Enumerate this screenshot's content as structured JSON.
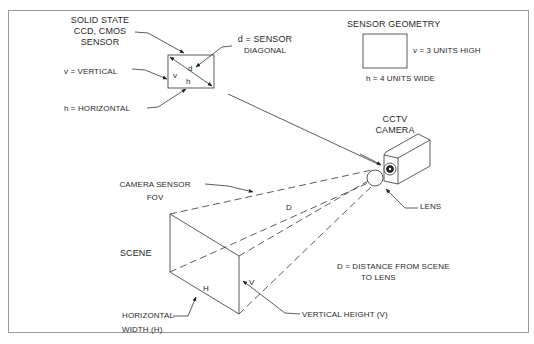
{
  "diagram": {
    "type": "cctv-camera-field-of-view-geometry",
    "colors": {
      "line": "#333333",
      "frame": "#9a9a9a",
      "background": "#ffffff"
    },
    "sensor_callout": {
      "title_line1": "SOLID STATE",
      "title_line2": "CCD, CMOS",
      "title_line3": "SENSOR",
      "vertical_label": "v = VERTICAL",
      "horizontal_label": "h = HORIZONTAL",
      "diagonal_label_line1": "d = SENSOR",
      "diagonal_label_line2": "DIAGONAL",
      "inner_v": "v",
      "inner_h": "h",
      "inner_d": "d"
    },
    "sensor_geometry": {
      "title": "SENSOR GEOMETRY",
      "height_label": "v = 3 UNITS HIGH",
      "width_label": "h = 4 UNITS WIDE"
    },
    "camera": {
      "label_line1": "CCTV",
      "label_line2": "CAMERA",
      "lens_label": "LENS"
    },
    "fov": {
      "label_line1": "CAMERA SENSOR",
      "label_line2": "FOV",
      "distance_symbol": "D",
      "distance_note_line1": "D = DISTANCE FROM SCENE",
      "distance_note_line2": "TO LENS"
    },
    "scene": {
      "label": "SCENE",
      "h_symbol": "H",
      "v_symbol": "V",
      "horizontal_label_line1": "HORIZONTAL",
      "horizontal_label_line2": "WIDTH (H)",
      "vertical_label": "VERTICAL HEIGHT (V)"
    }
  }
}
